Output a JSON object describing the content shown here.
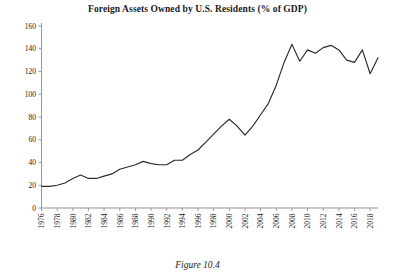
{
  "chart_data": {
    "type": "line",
    "title": "Foreign Assets Owned by U.S. Residents (% of GDP)",
    "caption": "Figure 10.4",
    "xlabel": "",
    "ylabel": "",
    "ylim": [
      0,
      160
    ],
    "ytick_step": 20,
    "yticks": [
      0,
      20,
      40,
      60,
      80,
      100,
      120,
      140,
      160
    ],
    "xlim": [
      1976,
      2019
    ],
    "xticks": [
      1976,
      1978,
      1980,
      1982,
      1984,
      1986,
      1988,
      1990,
      1992,
      1994,
      1996,
      1998,
      2000,
      2002,
      2004,
      2006,
      2008,
      2010,
      2012,
      2014,
      2016,
      2018
    ],
    "xtick_rotation": -90,
    "grid": false,
    "legend": false,
    "line_color": "#2b2b2b",
    "x": [
      1976,
      1977,
      1978,
      1979,
      1980,
      1981,
      1982,
      1983,
      1984,
      1985,
      1986,
      1987,
      1988,
      1989,
      1990,
      1991,
      1992,
      1993,
      1994,
      1995,
      1996,
      1997,
      1998,
      1999,
      2000,
      2001,
      2002,
      2003,
      2004,
      2005,
      2006,
      2007,
      2008,
      2009,
      2010,
      2011,
      2012,
      2013,
      2014,
      2015,
      2016,
      2017,
      2018,
      2019
    ],
    "values": [
      19,
      19,
      20,
      22,
      26,
      29,
      26,
      26,
      28,
      30,
      34,
      36,
      38,
      41,
      39,
      38,
      38,
      42,
      42,
      47,
      51,
      58,
      65,
      72,
      78,
      72,
      64,
      72,
      82,
      92,
      108,
      128,
      144,
      129,
      139,
      136,
      141,
      143,
      139,
      130,
      128,
      139,
      118,
      132
    ]
  }
}
